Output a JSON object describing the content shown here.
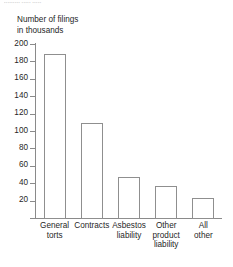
{
  "page": {
    "top_cut_text": "▪▪▪▪▪▪▪▪▪ ▪▪▪▪▪ ▪▪▪▪▪"
  },
  "chart_data": {
    "type": "bar",
    "title": "",
    "subtitle": "",
    "ylabel": "Number of filings\nin thousands",
    "xlabel": "",
    "categories": [
      "General\ntorts",
      "Contracts",
      "Asbestos\nliability",
      "Other\nproduct\nliability",
      "All\nother"
    ],
    "values": [
      190,
      110,
      48,
      38,
      24
    ],
    "ylim": [
      0,
      200
    ],
    "ytick_step": 20,
    "ytick_labels": [
      "20",
      "40",
      "60",
      "80",
      "100",
      "120",
      "140",
      "160",
      "180",
      "200"
    ],
    "ytick_values": [
      20,
      40,
      60,
      80,
      100,
      120,
      140,
      160,
      180,
      200
    ],
    "grid": false,
    "legend": false,
    "bar_fill": "#ffffff",
    "bar_stroke": "#8f8f8f",
    "axis_color": "#8a8a8a",
    "text_color": "#1f1f1f",
    "background": "#ffffff"
  }
}
